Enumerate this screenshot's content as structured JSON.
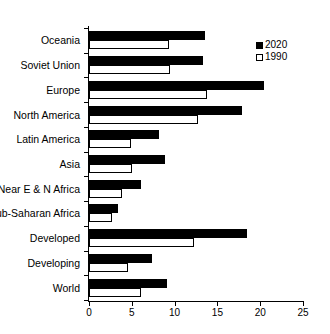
{
  "chart_data": {
    "type": "bar",
    "orientation": "horizontal",
    "title": "",
    "xlabel": "",
    "ylabel": "",
    "xlim": [
      0,
      25
    ],
    "xticks": [
      0,
      5,
      10,
      15,
      20,
      25
    ],
    "grid": false,
    "legend_position": "top-right",
    "categories": [
      "Oceania",
      "Soviet Union",
      "Europe",
      "North America",
      "Latin America",
      "Asia",
      "Near E & N Africa",
      "Sub-Saharan Africa",
      "Developed",
      "Developing",
      "World"
    ],
    "series": [
      {
        "name": "2020",
        "color": "#000000",
        "values": [
          13.6,
          13.3,
          20.5,
          17.9,
          8.2,
          8.9,
          6.1,
          3.4,
          18.5,
          7.4,
          9.1
        ]
      },
      {
        "name": "1990",
        "color": "#ffffff",
        "values": [
          9.3,
          9.5,
          13.8,
          12.7,
          4.9,
          5.0,
          3.9,
          2.7,
          12.3,
          4.5,
          6.1
        ]
      }
    ]
  },
  "legend": {
    "items": [
      {
        "label": "2020",
        "swatch": "filled-square"
      },
      {
        "label": "1990",
        "swatch": "hollow-square"
      }
    ]
  },
  "caption": {
    "text": ""
  }
}
